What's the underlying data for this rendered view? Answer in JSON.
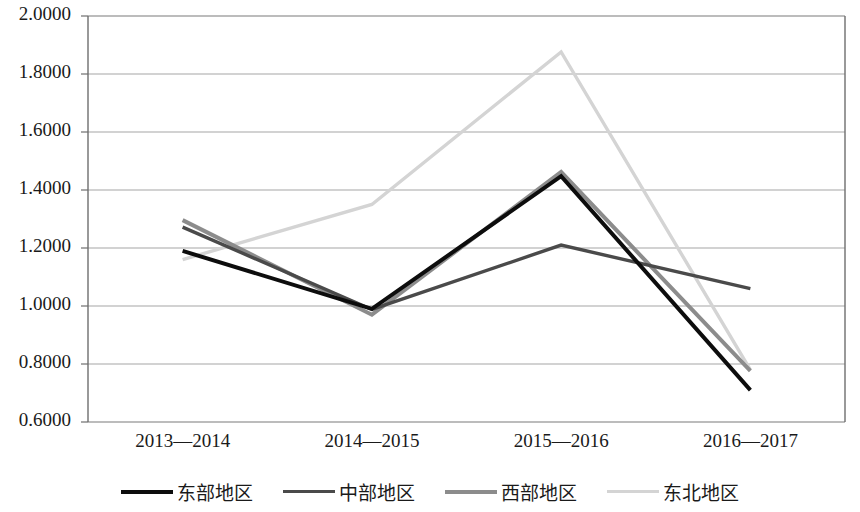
{
  "chart_data": {
    "type": "line",
    "title": "",
    "xlabel": "",
    "ylabel": "",
    "categories": [
      "2013—2014",
      "2014—2015",
      "2015—2016",
      "2016—2017"
    ],
    "ylim": [
      0.6,
      2.0
    ],
    "ytick_labels": [
      "2.0000",
      "1.8000",
      "1.6000",
      "1.4000",
      "1.2000",
      "1.0000",
      "0.8000",
      "0.6000"
    ],
    "ytick_values": [
      2.0,
      1.8,
      1.6,
      1.4,
      1.2,
      1.0,
      0.8,
      0.6
    ],
    "grid": true,
    "legend_position": "bottom",
    "series": [
      {
        "name": "东部地区",
        "color": "#0d0d0d",
        "width": 4.0,
        "values": [
          1.19,
          0.99,
          1.448,
          0.71
        ]
      },
      {
        "name": "中部地区",
        "color": "#4a4a4a",
        "width": 3.4,
        "values": [
          1.272,
          0.988,
          1.21,
          1.06
        ]
      },
      {
        "name": "西部地区",
        "color": "#8c8c8c",
        "width": 4.0,
        "values": [
          1.296,
          0.97,
          1.462,
          0.776
        ]
      },
      {
        "name": "东北地区",
        "color": "#d4d4d4",
        "width": 3.4,
        "values": [
          1.16,
          1.35,
          1.876,
          0.78
        ]
      }
    ]
  },
  "axis": {
    "border_color": "#6e6e6e",
    "grid_color": "#a6a6a6"
  }
}
